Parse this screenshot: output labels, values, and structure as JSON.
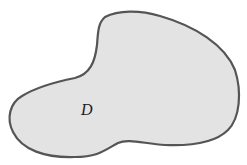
{
  "diagram": {
    "type": "region",
    "region": {
      "label": "D",
      "fill": "#e3e3e3",
      "stroke": "#555555"
    }
  }
}
